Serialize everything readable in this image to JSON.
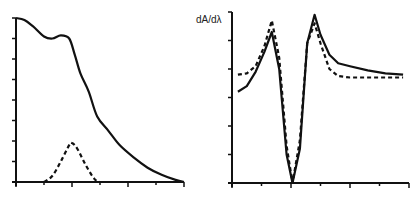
{
  "chart_data": [
    {
      "type": "line",
      "title": "",
      "xlabel": "",
      "ylabel": "",
      "grid": false,
      "legend": null,
      "x_ticks": 7,
      "y_ticks": 9,
      "xlim": [
        0,
        6
      ],
      "ylim": [
        0,
        8
      ],
      "series": [
        {
          "name": "absorbance (solid)",
          "style": "solid",
          "x": [
            0.0,
            0.3,
            0.6,
            1.0,
            1.3,
            1.6,
            1.9,
            2.1,
            2.3,
            2.6,
            2.9,
            3.3,
            3.7,
            4.2,
            4.7,
            5.2,
            5.7,
            6.0
          ],
          "y": [
            8.0,
            7.9,
            7.6,
            7.1,
            7.0,
            7.15,
            7.0,
            6.2,
            5.3,
            4.4,
            3.2,
            2.5,
            1.8,
            1.2,
            0.7,
            0.35,
            0.1,
            0.0
          ]
        },
        {
          "name": "band (dashed)",
          "style": "dashed",
          "x": [
            1.0,
            1.3,
            1.6,
            1.9,
            2.0,
            2.2,
            2.5,
            2.8,
            3.0
          ],
          "y": [
            0.0,
            0.3,
            1.0,
            1.8,
            1.9,
            1.6,
            0.8,
            0.15,
            0.0
          ]
        }
      ]
    },
    {
      "type": "line",
      "title": "",
      "xlabel": "",
      "ylabel": "dA/dλ",
      "grid": false,
      "legend": null,
      "x_ticks": 7,
      "y_ticks": 7,
      "xlim": [
        0,
        6
      ],
      "ylim": [
        0,
        6
      ],
      "series": [
        {
          "name": "derivative (solid)",
          "style": "solid",
          "x": [
            0.2,
            0.5,
            0.8,
            1.1,
            1.35,
            1.6,
            1.85,
            2.05,
            2.3,
            2.55,
            2.8,
            3.0,
            3.3,
            3.6,
            4.0,
            4.6,
            5.2,
            5.8
          ],
          "y": [
            3.2,
            3.4,
            3.9,
            4.6,
            5.3,
            4.0,
            1.0,
            0.0,
            1.2,
            4.9,
            5.9,
            5.2,
            4.5,
            4.2,
            4.1,
            3.95,
            3.85,
            3.8
          ],
          "markers": false
        },
        {
          "name": "derivative (dashed)",
          "style": "dashed",
          "x": [
            0.2,
            0.5,
            0.8,
            1.1,
            1.35,
            1.6,
            1.85,
            2.05,
            2.3,
            2.55,
            2.8,
            3.0,
            3.3,
            3.6,
            4.0,
            4.6,
            5.2,
            5.8
          ],
          "y": [
            3.8,
            3.85,
            4.1,
            4.8,
            5.7,
            4.4,
            1.3,
            0.0,
            1.5,
            4.9,
            5.6,
            4.9,
            4.0,
            3.75,
            3.7,
            3.7,
            3.7,
            3.7
          ]
        }
      ]
    }
  ],
  "labels": {
    "right_ylabel": "dA/dλ"
  }
}
